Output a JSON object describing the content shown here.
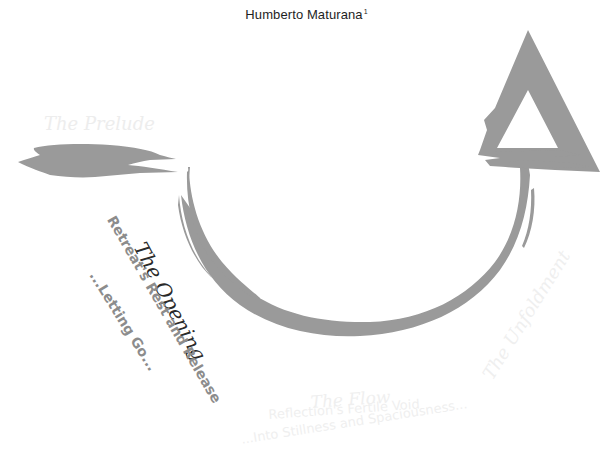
{
  "header": {
    "author": "Humberto Maturana",
    "footnote_marker": "1"
  },
  "diagram": {
    "type": "u-curve-process",
    "stroke_color": "#9a9a9a",
    "stages": [
      {
        "id": "prelude",
        "title": "The Prelude",
        "subtitle": "",
        "detail": "",
        "emphasis": "faded",
        "text_color": "#ededed"
      },
      {
        "id": "opening",
        "title": "The Opening",
        "subtitle": "Retreat's Rest and Release",
        "detail": "...Letting Go...",
        "emphasis": "active",
        "text_color": "#8c8c8c",
        "title_color": "#2a2a2a"
      },
      {
        "id": "flow",
        "title": "The Flow",
        "subtitle": "Reflection's Fertile Void",
        "detail": "...Into Stillness and Spaciousness...",
        "emphasis": "faded",
        "text_color": "#efefef"
      },
      {
        "id": "unfoldment",
        "title": "The Unfoldment",
        "subtitle": "",
        "detail": "",
        "emphasis": "faded",
        "text_color": "#efefef"
      }
    ],
    "shapes": [
      "brush-stroke-prelude",
      "u-curve-arc",
      "triangle-arrowhead"
    ]
  }
}
